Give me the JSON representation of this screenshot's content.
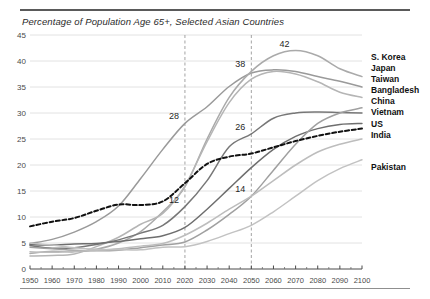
{
  "chart_data": {
    "type": "line",
    "title": "Percentage of Population Age 65+, Selected Asian Countries",
    "xlabel": "",
    "ylabel": "",
    "xlim": [
      1950,
      2100
    ],
    "ylim": [
      0,
      45
    ],
    "grid": "horizontal-gridlines-and-dashed-verticals",
    "legend_position": "right",
    "xticks": [
      1950,
      1960,
      1970,
      1980,
      1990,
      2000,
      2010,
      2020,
      2030,
      2040,
      2050,
      2060,
      2070,
      2080,
      2090,
      2100
    ],
    "yticks": [
      0,
      5,
      10,
      15,
      20,
      25,
      30,
      35,
      40,
      45
    ],
    "vertical_reference_lines": [
      2020,
      2050
    ],
    "x": [
      1950,
      1960,
      1970,
      1980,
      1990,
      2000,
      2010,
      2020,
      2030,
      2040,
      2050,
      2060,
      2070,
      2080,
      2090,
      2100
    ],
    "series": [
      {
        "name": "Japan",
        "color": "#9a9a9a",
        "style": "solid",
        "values": [
          4.9,
          5.7,
          7.1,
          9.1,
          12.1,
          17.4,
          23.0,
          28.0,
          31.2,
          35.1,
          37.7,
          38.3,
          38.0,
          37.0,
          36.1,
          35.0
        ]
      },
      {
        "name": "S. Korea",
        "color": "#aaaaaa",
        "style": "solid",
        "values": [
          3.0,
          3.4,
          3.3,
          3.8,
          5.0,
          7.2,
          11.0,
          15.8,
          25.0,
          33.0,
          38.0,
          41.0,
          42.0,
          41.0,
          38.5,
          37.0
        ]
      },
      {
        "name": "Taiwan",
        "color": "#b5b5b5",
        "style": "solid",
        "values": [
          2.5,
          2.6,
          2.9,
          4.3,
          6.1,
          8.6,
          10.7,
          16.0,
          24.5,
          32.0,
          36.5,
          38.0,
          37.5,
          36.0,
          34.0,
          33.0
        ]
      },
      {
        "name": "China",
        "color": "#777777",
        "style": "solid",
        "values": [
          4.5,
          4.0,
          4.1,
          4.7,
          5.6,
          6.9,
          8.4,
          12.0,
          17.0,
          23.5,
          26.0,
          29.0,
          30.0,
          30.2,
          30.1,
          30.0
        ]
      },
      {
        "name": "Vietnam",
        "color": "#6e6e6e",
        "style": "solid",
        "values": [
          4.7,
          4.6,
          4.8,
          4.9,
          5.3,
          5.8,
          6.4,
          8.0,
          11.5,
          15.5,
          19.5,
          23.0,
          25.5,
          27.0,
          27.8,
          28.0
        ]
      },
      {
        "name": "Bangladesh",
        "color": "#a0a0a0",
        "style": "solid",
        "values": [
          4.2,
          3.9,
          3.6,
          3.5,
          3.6,
          4.1,
          4.6,
          5.2,
          7.5,
          10.5,
          14.0,
          19.0,
          24.0,
          28.0,
          30.0,
          31.0
        ]
      },
      {
        "name": "India",
        "color": "#bdbdbd",
        "style": "solid",
        "values": [
          3.3,
          3.2,
          3.4,
          3.6,
          3.9,
          4.4,
          4.9,
          6.5,
          8.8,
          11.5,
          14.0,
          17.0,
          20.0,
          22.5,
          24.0,
          25.0
        ]
      },
      {
        "name": "US",
        "color": "#111111",
        "style": "dashed",
        "values": [
          8.2,
          9.1,
          9.8,
          11.2,
          12.4,
          12.3,
          13.0,
          16.5,
          20.2,
          21.6,
          22.2,
          23.4,
          24.6,
          25.6,
          26.4,
          27.0
        ]
      },
      {
        "name": "Pakistan",
        "color": "#c2c2c2",
        "style": "solid",
        "values": [
          5.0,
          4.6,
          4.1,
          3.8,
          3.7,
          3.7,
          4.2,
          4.3,
          5.3,
          6.8,
          8.4,
          11.0,
          14.0,
          17.0,
          19.3,
          21.0
        ]
      }
    ],
    "annotations": [
      {
        "label": "28",
        "x": 2020,
        "y": 28
      },
      {
        "label": "12",
        "x": 2020,
        "y": 12
      },
      {
        "label": "38",
        "x": 2050,
        "y": 38
      },
      {
        "label": "26",
        "x": 2050,
        "y": 26
      },
      {
        "label": "14",
        "x": 2050,
        "y": 14
      },
      {
        "label": "42",
        "x": 2070,
        "y": 42
      }
    ]
  },
  "legend": {
    "items": [
      {
        "label": "S. Korea"
      },
      {
        "label": "Japan"
      },
      {
        "label": "Taiwan"
      },
      {
        "label": "Bangladesh"
      },
      {
        "label": "China"
      },
      {
        "label": "Vietnam"
      },
      {
        "label": "US"
      },
      {
        "label": "India"
      }
    ],
    "separate": {
      "label": "Pakistan"
    }
  }
}
